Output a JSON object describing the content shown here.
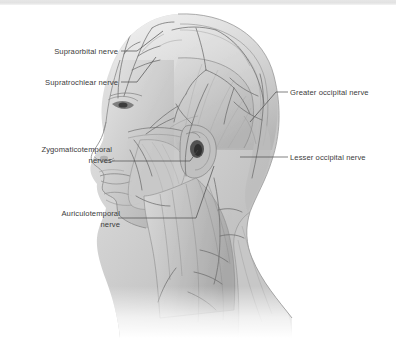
{
  "figure": {
    "name": "lateral-head-nerve-illustration",
    "style": "grayscale-anatomical-drawing",
    "background_color": "#ffffff",
    "border_color": "#e2e2e2",
    "label_color": "#3b3b3b",
    "leader_color": "#4a4a4a"
  },
  "labels": {
    "supraorbital": "Supraorbital nerve",
    "supratrochlear": "Supratrochlear nerve",
    "zygomaticotemporal": "Zygomaticotemporal\nnerves",
    "auriculotemporal": "Auriculotemporal\nnerve",
    "greater_occipital": "Greater occipital nerve",
    "lesser_occipital": "Lesser occipital nerve"
  }
}
